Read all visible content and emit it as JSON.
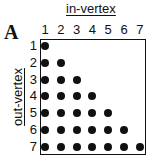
{
  "panel": {
    "letter": "A",
    "x_label": "in-vertex",
    "y_label": "out-vertex",
    "columns": [
      "1",
      "2",
      "3",
      "4",
      "5",
      "6",
      "7"
    ],
    "rows": [
      "1",
      "2",
      "3",
      "4",
      "5",
      "6",
      "7"
    ],
    "dot_color": "#111111",
    "matrix_description": "Lower-triangular incidence matrix: a dot at (out-vertex i, in-vertex j) for all j <= i",
    "dots": [
      [
        1,
        1
      ],
      [
        2,
        1
      ],
      [
        2,
        2
      ],
      [
        3,
        1
      ],
      [
        3,
        2
      ],
      [
        3,
        3
      ],
      [
        4,
        1
      ],
      [
        4,
        2
      ],
      [
        4,
        3
      ],
      [
        4,
        4
      ],
      [
        5,
        1
      ],
      [
        5,
        2
      ],
      [
        5,
        3
      ],
      [
        5,
        4
      ],
      [
        5,
        5
      ],
      [
        6,
        1
      ],
      [
        6,
        2
      ],
      [
        6,
        3
      ],
      [
        6,
        4
      ],
      [
        6,
        5
      ],
      [
        6,
        6
      ],
      [
        7,
        1
      ],
      [
        7,
        2
      ],
      [
        7,
        3
      ],
      [
        7,
        4
      ],
      [
        7,
        5
      ],
      [
        7,
        6
      ],
      [
        7,
        7
      ]
    ]
  }
}
